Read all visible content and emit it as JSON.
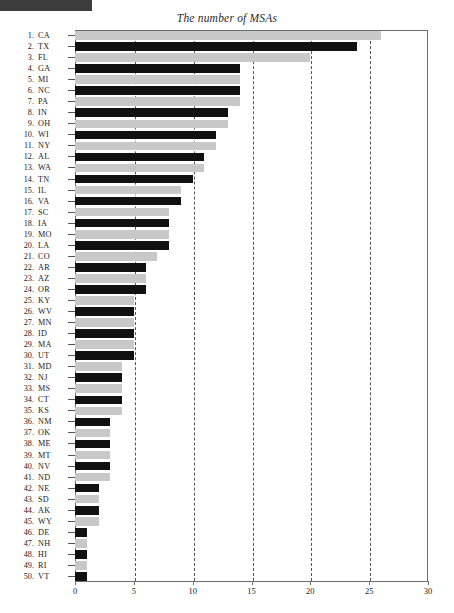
{
  "chart_data": {
    "type": "bar",
    "orientation": "horizontal",
    "title": "The number of MSAs",
    "xlabel": "",
    "ylabel": "",
    "xlim": [
      0,
      30
    ],
    "xticks": [
      0,
      5,
      10,
      15,
      20,
      25,
      30
    ],
    "grid": "vertical dashed gridlines at 5, 10, 15, 20, 25",
    "legend": "none",
    "bar_colors": {
      "odd_rows": "#c8c8c8",
      "even_rows": "#111111"
    },
    "categories": [
      "CA",
      "TX",
      "FL",
      "GA",
      "MI",
      "NC",
      "PA",
      "IN",
      "OH",
      "WI",
      "NY",
      "AL",
      "WA",
      "TN",
      "IL",
      "VA",
      "SC",
      "IA",
      "MO",
      "LA",
      "CO",
      "AR",
      "AZ",
      "OR",
      "KY",
      "WV",
      "MN",
      "ID",
      "MA",
      "UT",
      "MD",
      "NJ",
      "MS",
      "CT",
      "KS",
      "NM",
      "OK",
      "ME",
      "MT",
      "NV",
      "ND",
      "NE",
      "SD",
      "AK",
      "WY",
      "DE",
      "NH",
      "HI",
      "RI",
      "VT"
    ],
    "values": [
      26,
      24,
      20,
      14,
      14,
      14,
      14,
      13,
      13,
      12,
      12,
      11,
      11,
      10,
      9,
      9,
      8,
      8,
      8,
      8,
      7,
      6,
      6,
      6,
      5,
      5,
      5,
      5,
      5,
      5,
      4,
      4,
      4,
      4,
      4,
      3,
      3,
      3,
      3,
      3,
      3,
      2,
      2,
      2,
      2,
      1,
      1,
      1,
      1,
      1
    ],
    "ranks": [
      "1.",
      "2.",
      "3.",
      "4.",
      "5.",
      "6.",
      "7.",
      "8.",
      "9.",
      "10.",
      "11.",
      "12.",
      "13.",
      "14.",
      "15.",
      "16.",
      "17.",
      "18.",
      "19.",
      "20.",
      "21.",
      "22.",
      "23.",
      "24.",
      "25.",
      "26.",
      "27.",
      "28.",
      "29.",
      "30.",
      "31.",
      "32.",
      "33.",
      "34.",
      "35.",
      "36.",
      "37.",
      "38.",
      "39.",
      "40.",
      "41.",
      "42.",
      "43.",
      "44.",
      "45.",
      "46.",
      "47.",
      "48.",
      "49.",
      "50."
    ]
  }
}
